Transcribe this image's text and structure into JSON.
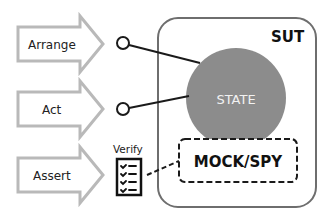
{
  "diagram": {
    "steps": [
      {
        "label": "Arrange",
        "connector": "open-circle"
      },
      {
        "label": "Act",
        "connector": "open-circle"
      },
      {
        "label": "Assert",
        "connector": "verify-checklist"
      }
    ],
    "sut": {
      "label": "SUT"
    },
    "state": {
      "label": "STATE"
    },
    "mock": {
      "label": "MOCK/SPY"
    },
    "verify": {
      "label": "Verify",
      "icon": "checklist-icon"
    },
    "colors": {
      "arrow_stroke": "#b9b9b9",
      "sut_border": "#6e6e6e",
      "state_fill": "#8c8c8c",
      "line": "#1a1a1a"
    }
  }
}
